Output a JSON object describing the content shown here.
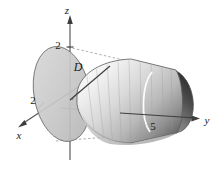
{
  "figure": {
    "type": "3d-math-diagram",
    "background_color": "#ffffff",
    "axes": [
      {
        "id": "z",
        "label": "z",
        "direction": "up",
        "arrow": true,
        "tick_value": "2",
        "color": "#555555"
      },
      {
        "id": "x",
        "label": "x",
        "direction": "down-left",
        "arrow": true,
        "tick_value": "2",
        "color": "#555555"
      },
      {
        "id": "y",
        "label": "y",
        "direction": "right",
        "arrow": true,
        "tick_value": "5",
        "color": "#555555"
      }
    ],
    "ticks": {
      "z_tick": "2",
      "x_tick": "2",
      "y_tick": "5"
    },
    "labels": {
      "z_axis": "z",
      "x_axis": "x",
      "y_axis": "y",
      "region": "D"
    },
    "shapes": {
      "disk": {
        "name": "disk-region-D",
        "label": "D",
        "fill": "#c8c8c8",
        "stroke": "#6e6e6e"
      },
      "cone": {
        "name": "cone-solid",
        "surface_fill_light": "#f2f2f2",
        "surface_fill_mid": "#b5b5b5",
        "surface_fill_dark": "#6a6a6a",
        "opening_fill_dark": "#4a4a4a",
        "stroke": "#5a5a5a"
      },
      "construction_lines": {
        "name": "dashed-tangent-lines",
        "style": "dashed",
        "color": "#8a8a8a"
      }
    },
    "colors": {
      "ink": "#1a1a1a",
      "axis": "#555555",
      "dash": "#8a8a8a",
      "disk_fill": "#c8c8c8"
    }
  }
}
